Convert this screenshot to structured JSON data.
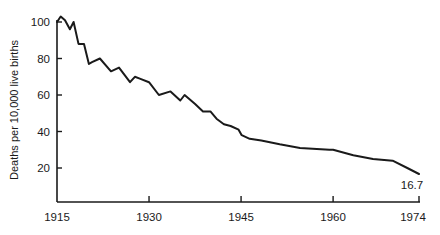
{
  "chart_data": {
    "type": "line",
    "title": "",
    "xlabel": "",
    "ylabel": "Deaths per 10,000 live births",
    "xlim": [
      1915,
      1974
    ],
    "ylim": [
      0,
      105
    ],
    "x_ticks": [
      1915,
      1930,
      1945,
      1960,
      1974
    ],
    "x_tick_labels": [
      "1915",
      "1930",
      "1945",
      "1960",
      "1974"
    ],
    "y_ticks": [
      20,
      40,
      60,
      80,
      100
    ],
    "y_tick_labels": [
      "20",
      "40",
      "60",
      "80",
      "100"
    ],
    "grid": false,
    "legend": null,
    "series": [
      {
        "name": "Infant mortality rate",
        "color": "#1a1a1a",
        "x": [
          1915,
          1915.6,
          1916.3,
          1917.1,
          1917.7,
          1918.5,
          1919.4,
          1920.2,
          1920.7,
          1922,
          1923.8,
          1925.1,
          1926.9,
          1927.7,
          1928.5,
          1930,
          1931.6,
          1933.5,
          1935.1,
          1935.8,
          1937.5,
          1938.8,
          1940,
          1941,
          1942.2,
          1943.3,
          1944.6,
          1945.1,
          1946.4,
          1948.3,
          1951.3,
          1954.6,
          1959.4,
          1960,
          1963.3,
          1966.5,
          1969.7,
          1972.1,
          1974
        ],
        "y": [
          100,
          103,
          101,
          96,
          100,
          88,
          88,
          77,
          78,
          80,
          73,
          75,
          67,
          70,
          69,
          67,
          60,
          62,
          57,
          60,
          55,
          51,
          51,
          47,
          44,
          43,
          41,
          38,
          36,
          35,
          33,
          31,
          30,
          30,
          27,
          25,
          24,
          20,
          16.7
        ]
      }
    ],
    "annotations": [
      {
        "text": "16.7",
        "x": 1974,
        "y": 16.7,
        "position": "below"
      }
    ]
  }
}
